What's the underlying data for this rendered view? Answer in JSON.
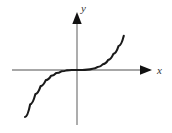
{
  "figure": {
    "background_color": "#ffffff",
    "width": 172,
    "height": 133
  },
  "chart_data": {
    "type": "line",
    "title": "",
    "subtitle": "",
    "xlabel": "x",
    "ylabel": "y",
    "function": "y = x^3",
    "grid": false,
    "legend": null,
    "xlim": [
      -1.45,
      1.45
    ],
    "ylim": [
      -1.45,
      1.45
    ],
    "xticks": [],
    "yticks": [],
    "xtick_labels": [],
    "ytick_labels": [],
    "series": [
      {
        "name": "y = x^3",
        "color": "#1a1a1a",
        "x": [
          -1.3,
          -1.2,
          -1.1,
          -1.0,
          -0.9,
          -0.8,
          -0.7,
          -0.6,
          -0.5,
          -0.4,
          -0.3,
          -0.2,
          -0.1,
          0.0,
          0.1,
          0.2,
          0.3,
          0.4,
          0.5,
          0.6,
          0.7,
          0.8,
          0.9,
          1.0,
          1.1,
          1.2,
          1.3
        ],
        "y": [
          -2.197,
          -1.728,
          -1.331,
          -1.0,
          -0.729,
          -0.512,
          -0.343,
          -0.216,
          -0.125,
          -0.064,
          -0.027,
          -0.008,
          -0.001,
          0.0,
          0.001,
          0.008,
          0.027,
          0.064,
          0.125,
          0.216,
          0.343,
          0.512,
          0.729,
          1.0,
          1.331,
          1.728,
          2.197
        ]
      }
    ],
    "annotations": []
  },
  "axes": {
    "color": "#8a8a8a",
    "arrow_color": "#111111",
    "x_axis_label": "x",
    "y_axis_label": "y",
    "x_axis_name": "horizontal-axis",
    "y_axis_name": "vertical-axis"
  },
  "icons": {
    "x_arrow": "arrow-right-icon",
    "y_arrow": "arrow-up-icon"
  }
}
